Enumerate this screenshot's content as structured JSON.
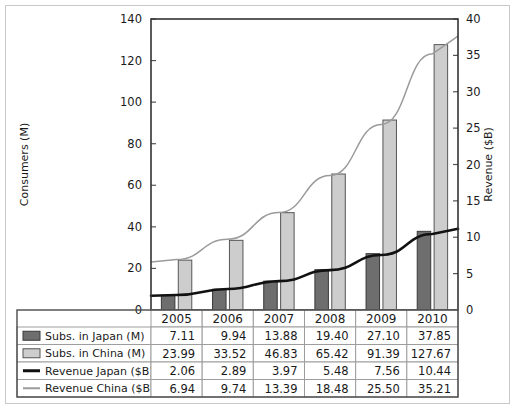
{
  "chart_data": {
    "type": "bar",
    "title": "",
    "subtitle": "",
    "categories": [
      "2005",
      "2006",
      "2007",
      "2008",
      "2009",
      "2010"
    ],
    "xlabel": "",
    "ylabel": "Consumers (M)",
    "y2label": "Revenue ($B)",
    "ylim": [
      0,
      140
    ],
    "y2lim": [
      0,
      40
    ],
    "yticks": [
      0,
      20,
      40,
      60,
      80,
      100,
      120,
      140
    ],
    "y2ticks": [
      0,
      5,
      10,
      15,
      20,
      25,
      30,
      35,
      40
    ],
    "grid": false,
    "legend_position": "table-below",
    "series": [
      {
        "name": "Subs. in Japan (M)",
        "kind": "bar",
        "axis": "left",
        "color": "#6e6e6e",
        "edge": "#3a3a3a",
        "values": [
          7.11,
          9.94,
          13.88,
          19.4,
          27.1,
          37.85
        ],
        "labels": [
          "7.11",
          "9.94",
          "13.88",
          "19.40",
          "27.10",
          "37.85"
        ]
      },
      {
        "name": "Subs. in China (M)",
        "kind": "bar",
        "axis": "left",
        "color": "#cdcdcd",
        "edge": "#555555",
        "values": [
          23.99,
          33.52,
          46.83,
          65.42,
          91.39,
          127.67
        ],
        "labels": [
          "23.99",
          "33.52",
          "46.83",
          "65.42",
          "91.39",
          "127.67"
        ]
      },
      {
        "name": "Revenue Japan ($B)",
        "kind": "line",
        "axis": "right",
        "color": "#111111",
        "values": [
          2.06,
          2.89,
          3.97,
          5.48,
          7.56,
          10.44
        ],
        "labels": [
          "2.06",
          "2.89",
          "3.97",
          "5.48",
          "7.56",
          "10.44"
        ]
      },
      {
        "name": "Revenue China ($B)",
        "kind": "line",
        "axis": "right",
        "color": "#9b9b9b",
        "values": [
          6.94,
          9.74,
          13.39,
          18.48,
          25.5,
          35.21
        ],
        "labels": [
          "6.94",
          "9.74",
          "13.39",
          "18.48",
          "25.50",
          "35.21"
        ]
      }
    ]
  },
  "axes": {
    "left_title": "Consumers (M)",
    "right_title": "Revenue ($B)",
    "left_ticks": [
      "0",
      "20",
      "40",
      "60",
      "80",
      "100",
      "120",
      "140"
    ],
    "right_ticks": [
      "0",
      "5",
      "10",
      "15",
      "20",
      "25",
      "30",
      "35",
      "40"
    ]
  },
  "data_table": {
    "header": [
      "",
      "2005",
      "2006",
      "2007",
      "2008",
      "2009",
      "2010"
    ],
    "rows": [
      {
        "label": "Subs. in Japan (M)",
        "swatch": "bar-dark-swatch",
        "values": [
          "7.11",
          "9.94",
          "13.88",
          "19.40",
          "27.10",
          "37.85"
        ]
      },
      {
        "label": "Subs. in China (M)",
        "swatch": "bar-light-swatch",
        "values": [
          "23.99",
          "33.52",
          "46.83",
          "65.42",
          "91.39",
          "127.67"
        ]
      },
      {
        "label": "Revenue Japan ($B)",
        "swatch": "line-black-swatch",
        "values": [
          "2.06",
          "2.89",
          "3.97",
          "5.48",
          "7.56",
          "10.44"
        ]
      },
      {
        "label": "Revenue China ($B)",
        "swatch": "line-gray-swatch",
        "values": [
          "6.94",
          "9.74",
          "13.39",
          "18.48",
          "25.50",
          "35.21"
        ]
      }
    ]
  },
  "colors": {
    "japan_bar": "#6e6e6e",
    "china_bar": "#cdcdcd",
    "japan_line": "#111111",
    "china_line": "#9b9b9b",
    "frame": "#333333",
    "outer_border": "#c9c9c9",
    "text": "#1a1a1a"
  }
}
